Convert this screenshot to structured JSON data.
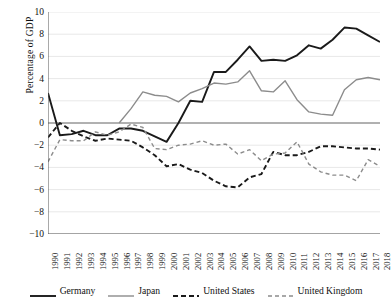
{
  "chart_data": {
    "type": "line",
    "title": "",
    "xlabel": "",
    "ylabel": "Percentage of GDP",
    "xlim": [
      1990,
      2018
    ],
    "ylim": [
      -10,
      10
    ],
    "ytick_values": [
      10,
      8,
      6,
      4,
      2,
      0,
      -2,
      -4,
      -6,
      -8,
      -10
    ],
    "ytick_labels": [
      "10",
      "8",
      "6",
      "4",
      "2",
      "0",
      "−2",
      "−4",
      "−6",
      "−8",
      "−10"
    ],
    "grid": true,
    "grid_axis": "y",
    "legend_position": "bottom",
    "zero_line": true,
    "x": [
      1990,
      1991,
      1992,
      1993,
      1994,
      1995,
      1996,
      1997,
      1998,
      1999,
      2000,
      2001,
      2002,
      2003,
      2004,
      2005,
      2006,
      2007,
      2008,
      2009,
      2010,
      2011,
      2012,
      2013,
      2014,
      2015,
      2016,
      2017,
      2018
    ],
    "xtick_labels": [
      "1990",
      "1991",
      "1992",
      "1993",
      "1994",
      "1995",
      "1996",
      "1997",
      "1998",
      "1999",
      "2000",
      "2001",
      "2002",
      "2003",
      "2004",
      "2005",
      "2006",
      "2007",
      "2008",
      "2009",
      "2010",
      "2011",
      "2012",
      "2013",
      "2014",
      "2015",
      "2016",
      "2017",
      "2018"
    ],
    "series": [
      {
        "name": "Germany",
        "color": "#1a1a1a",
        "style": "solid",
        "width": 1.9,
        "values": [
          2.7,
          -1.1,
          -1.0,
          -0.7,
          -1.1,
          -1.1,
          -0.5,
          -0.5,
          -0.7,
          -1.2,
          -1.7,
          0.0,
          2.0,
          1.9,
          4.6,
          4.6,
          5.7,
          6.9,
          5.6,
          5.7,
          5.6,
          6.1,
          7.0,
          6.7,
          7.5,
          8.6,
          8.5,
          7.9,
          7.3
        ]
      },
      {
        "name": "Japan",
        "color": "#8c8c8c",
        "style": "solid",
        "width": 1.4,
        "values": [
          null,
          null,
          null,
          null,
          null,
          null,
          0.0,
          1.3,
          2.8,
          2.5,
          2.4,
          1.9,
          2.7,
          3.1,
          3.6,
          3.5,
          3.7,
          4.7,
          2.9,
          2.8,
          3.8,
          2.1,
          1.0,
          0.8,
          0.7,
          3.0,
          3.9,
          4.1,
          3.9
        ]
      },
      {
        "name": "United States",
        "color": "#1a1a1a",
        "style": "dashed",
        "width": 1.9,
        "values": [
          -1.3,
          0.0,
          -0.7,
          -1.2,
          -1.6,
          -1.4,
          -1.5,
          -1.6,
          -2.2,
          -2.9,
          -3.9,
          -3.7,
          -4.2,
          -4.5,
          -5.2,
          -5.7,
          -5.8,
          -4.9,
          -4.6,
          -2.6,
          -2.9,
          -2.9,
          -2.6,
          -2.1,
          -2.1,
          -2.2,
          -2.3,
          -2.3,
          -2.4
        ]
      },
      {
        "name": "United Kingdom",
        "color": "#8c8c8c",
        "style": "dashed",
        "width": 1.4,
        "values": [
          -3.5,
          -1.5,
          -1.6,
          -1.6,
          -0.8,
          -1.1,
          -0.8,
          -0.1,
          -0.4,
          -2.3,
          -2.4,
          -2.0,
          -1.9,
          -1.6,
          -2.0,
          -1.9,
          -2.8,
          -2.4,
          -3.4,
          -2.8,
          -2.7,
          -1.7,
          -3.7,
          -4.4,
          -4.7,
          -4.7,
          -5.2,
          -3.3,
          -3.9
        ]
      }
    ]
  },
  "legend": {
    "items": [
      {
        "label": "Germany"
      },
      {
        "label": "Japan"
      },
      {
        "label": "United States"
      },
      {
        "label": "United Kingdom"
      }
    ]
  }
}
